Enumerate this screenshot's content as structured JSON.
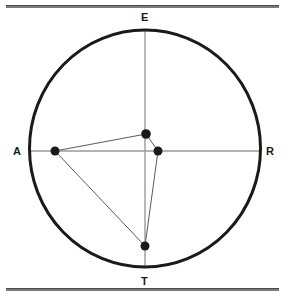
{
  "figure": {
    "title_labels": {
      "top": "E",
      "left": "A",
      "right": "R",
      "bottom": "T"
    },
    "colors": {
      "circle_stroke": "#1a1a1a",
      "axis_stroke": "#9a9a9a",
      "polygon_stroke": "#5a5a5a",
      "point_fill": "#1a1a1a",
      "rule_stroke": "#7b7b7b",
      "background": "#ffffff"
    },
    "circle": {
      "center_x": 145,
      "center_y": 148.5,
      "radius_x": 115.5,
      "radius_y": 118.5,
      "stroke_width": 3
    },
    "axes": [
      {
        "name": "vertical-axis",
        "x1": 145,
        "y1": 30,
        "x2": 145,
        "y2": 267
      },
      {
        "name": "horizontal-axis",
        "x1": 28,
        "y1": 151,
        "x2": 261,
        "y2": 151
      }
    ],
    "points": [
      {
        "name": "point-left",
        "x": 55,
        "y": 151,
        "r": 4.5
      },
      {
        "name": "point-center-top",
        "x": 146,
        "y": 134,
        "r": 4.8
      },
      {
        "name": "point-center-right",
        "x": 158,
        "y": 151,
        "r": 4.5
      },
      {
        "name": "point-bottom",
        "x": 145,
        "y": 246,
        "r": 4.5
      }
    ],
    "polygon": {
      "name": "inscribed-quadrilateral",
      "vertices": [
        {
          "x": 55,
          "y": 151
        },
        {
          "x": 146,
          "y": 134
        },
        {
          "x": 158,
          "y": 151
        },
        {
          "x": 145,
          "y": 246
        }
      ],
      "closed": true,
      "stroke_width": 1
    },
    "rules": [
      {
        "name": "rule-top",
        "y": 5
      },
      {
        "name": "rule-bottom",
        "y": 288
      }
    ]
  }
}
